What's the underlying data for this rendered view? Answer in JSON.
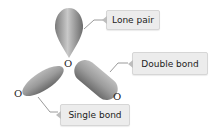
{
  "diagram": {
    "type": "orbital-geometry",
    "atoms": {
      "center": "O",
      "left": "O",
      "right": "O"
    },
    "labels": {
      "lone_pair": "Lone pair",
      "double_bond": "Double bond",
      "single_bond": "Single bond"
    },
    "colors": {
      "lobe_light": "#c8c8c8",
      "lobe_dark": "#6e6e6e",
      "label_bg": "#ececec",
      "label_border": "#d6d6d6",
      "connector": "#9a9a9a"
    }
  }
}
